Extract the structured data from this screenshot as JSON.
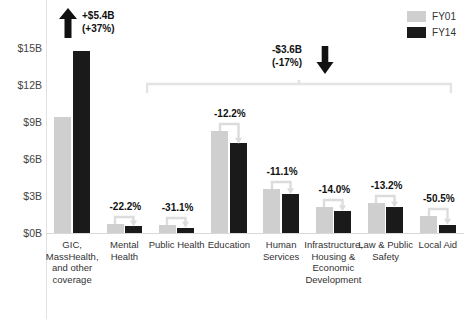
{
  "chart_data": {
    "type": "bar",
    "title": "",
    "xlabel": "",
    "ylabel": "",
    "ylim": [
      0,
      16.5
    ],
    "grid": false,
    "legend_position": "top-right",
    "categories": [
      "GIC, MassHealth, and other coverage",
      "Mental Health",
      "Public Health",
      "Education",
      "Human Services",
      "Infrastructure, Housing & Economic Development",
      "Law & Public Safety",
      "Local Aid"
    ],
    "series": [
      {
        "name": "FY01",
        "color": "#cfcfcf",
        "values": [
          9.4,
          0.72,
          0.62,
          8.3,
          3.55,
          2.1,
          2.45,
          1.35
        ]
      },
      {
        "name": "FY14",
        "color": "#1a1a1a",
        "values": [
          14.8,
          0.56,
          0.43,
          7.3,
          3.16,
          1.8,
          2.13,
          0.67
        ]
      }
    ],
    "bar_labels": [
      "",
      "-22.2%",
      "-31.1%",
      "-12.2%",
      "-11.1%",
      "-14.0%",
      "-13.2%",
      "-50.5%"
    ],
    "y_ticks": [
      "$0B",
      "$3B",
      "$6B",
      "$9B",
      "$12B",
      "$15B"
    ],
    "y_tick_values": [
      0,
      3,
      6,
      9,
      12,
      15
    ],
    "annotations": [
      {
        "id": "gic-growth",
        "line1": "+$5.4B",
        "line2": "(+37%)",
        "arrow": "up"
      },
      {
        "id": "rest-decline",
        "line1": "-$3.6B",
        "line2": "(-17%)",
        "arrow": "down"
      }
    ]
  },
  "legend": {
    "items": [
      {
        "label": "FY01",
        "color": "#cfcfcf"
      },
      {
        "label": "FY14",
        "color": "#1a1a1a"
      }
    ]
  },
  "icons": {
    "arrow_up": "up-arrow-icon",
    "arrow_down": "down-arrow-icon",
    "bracket": "span-bracket-icon"
  }
}
